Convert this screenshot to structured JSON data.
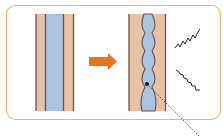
{
  "diagram": {
    "type": "before-after-vessel-illustration",
    "colors": {
      "frame_border": "#f0b27a",
      "wall": "#e8c2a6",
      "wall_line": "#6b4f4a",
      "lumen": "#a9c3e0",
      "arrow": "#e8761e",
      "zigzag": "#222222",
      "pointer": "#333333"
    },
    "panels": [
      {
        "name": "normal-vessel",
        "shape": "straight"
      },
      {
        "name": "constricted-vessel",
        "shape": "wavy"
      }
    ],
    "arrow": {
      "direction": "right"
    },
    "symbols": [
      {
        "name": "zigzag-upper"
      },
      {
        "name": "zigzag-lower"
      }
    ],
    "pointer": {
      "from": "lumen-point",
      "direction": "down-right"
    }
  }
}
